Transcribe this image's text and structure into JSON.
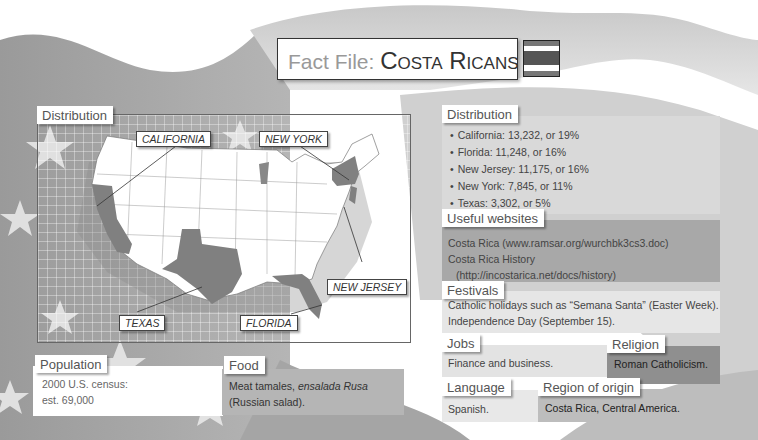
{
  "title": {
    "prefix": "Fact File: ",
    "subject": "Costa Ricans"
  },
  "flag": {
    "name": "costa-rica-flag",
    "stripes": [
      "#777777",
      "#ffffff",
      "#555555",
      "#ffffff",
      "#777777"
    ]
  },
  "map_section": {
    "label": "Distribution",
    "states": {
      "california": "CALIFORNIA",
      "new_york": "NEW YORK",
      "new_jersey": "NEW JERSEY",
      "texas": "TEXAS",
      "florida": "FLORIDA"
    }
  },
  "distribution": {
    "label": "Distribution",
    "items": [
      "California: 13,232, or 19%",
      "Florida: 11,248, or 16%",
      "New Jersey: 11,175, or 16%",
      "New York: 7,845, or 11%",
      "Texas: 3,302, or 5%"
    ]
  },
  "websites": {
    "label": "Useful websites",
    "lines": [
      "Costa Rica (www.ramsar.org/wurchbk3cs3.doc)",
      "Costa Rica History",
      "(http://incostarica.net/docs/history)"
    ]
  },
  "festivals": {
    "label": "Festivals",
    "lines": [
      "Catholic holidays such as “Semana Santa” (Easter Week).",
      "Independence Day (September 15)."
    ]
  },
  "jobs": {
    "label": "Jobs",
    "text": "Finance and business."
  },
  "religion": {
    "label": "Religion",
    "text": "Roman Catholicism."
  },
  "language": {
    "label": "Language",
    "text": "Spanish."
  },
  "region": {
    "label": "Region of origin",
    "text": "Costa Rica, Central America."
  },
  "population": {
    "label": "Population",
    "lines": [
      "2000 U.S. census:",
      "est. 69,000"
    ]
  },
  "food": {
    "label": "Food",
    "text_plain": "Meat tamales, ",
    "text_italic": "ensalada Rusa",
    "text_line2": "(Russian salad)."
  },
  "colors": {
    "panel_light": "#d9d9d9",
    "panel_mid": "#bdbdbd",
    "panel_dark": "#8f8f8f",
    "white": "#ffffff"
  }
}
